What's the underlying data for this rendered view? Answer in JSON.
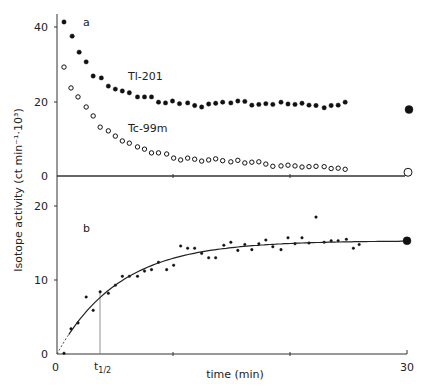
{
  "chart_data": [
    {
      "panel": "a",
      "type": "scatter",
      "title": "",
      "panel_label": "a",
      "xlabel": "time (min)",
      "ylabel": "Isotope activity (ct min-1·10^3)",
      "xlim": [
        0,
        30
      ],
      "ylim": [
        0,
        44
      ],
      "yticks": [
        0,
        20,
        40
      ],
      "grid": false,
      "series": [
        {
          "name": "Tl-201",
          "marker": "filled",
          "x": [
            0.6,
            1.3,
            1.9,
            2.5,
            3.1,
            3.8,
            4.4,
            5.0,
            5.6,
            6.2,
            6.9,
            7.5,
            8.1,
            8.7,
            9.3,
            9.9,
            10.5,
            11.2,
            11.8,
            12.4,
            13.0,
            13.6,
            14.2,
            14.9,
            15.5,
            16.1,
            16.7,
            17.3,
            17.9,
            18.5,
            19.2,
            19.8,
            20.4,
            21.0,
            21.6,
            22.2,
            22.9,
            23.5,
            24.1,
            24.7
          ],
          "y": [
            41.3,
            37.5,
            33.2,
            30.6,
            26.8,
            26.3,
            24.1,
            23.3,
            22.8,
            22.3,
            21.2,
            21.2,
            21.2,
            19.8,
            19.6,
            20.1,
            19.4,
            19.6,
            18.9,
            18.5,
            19.3,
            19.5,
            19.8,
            19.6,
            20.1,
            20.0,
            19.0,
            19.2,
            19.4,
            19.2,
            19.8,
            19.3,
            19.2,
            19.5,
            19.0,
            18.9,
            18.3,
            18.9,
            19.0,
            19.8
          ],
          "annotation": "Tl-201",
          "end_value": {
            "x": 30,
            "y": 17.8,
            "marker": "large-filled"
          }
        },
        {
          "name": "Tc-99m",
          "marker": "open",
          "x": [
            0.6,
            1.2,
            1.8,
            2.5,
            3.1,
            3.7,
            4.4,
            5.0,
            5.6,
            6.2,
            6.9,
            7.5,
            8.1,
            8.7,
            9.4,
            10.0,
            10.6,
            11.2,
            11.8,
            12.4,
            13.0,
            13.6,
            14.2,
            14.9,
            15.5,
            16.1,
            16.7,
            17.3,
            17.9,
            18.5,
            19.2,
            19.8,
            20.4,
            21.0,
            21.6,
            22.2,
            22.9,
            23.5,
            24.1,
            24.7
          ],
          "y": [
            29.2,
            23.6,
            21.2,
            18.5,
            16.1,
            13.1,
            12.1,
            10.7,
            9.4,
            8.8,
            7.8,
            7.2,
            6.2,
            6.2,
            5.9,
            4.8,
            4.3,
            4.8,
            4.5,
            4.0,
            4.3,
            4.6,
            4.1,
            3.8,
            4.2,
            3.5,
            3.7,
            3.8,
            3.2,
            2.6,
            2.7,
            2.9,
            2.7,
            2.4,
            2.5,
            2.6,
            2.5,
            2.0,
            2.1,
            1.8
          ],
          "annotation": "Tc-99m",
          "end_value": {
            "x": 30,
            "y": 1.0,
            "marker": "large-open"
          }
        }
      ]
    },
    {
      "panel": "b",
      "type": "scatter",
      "title": "",
      "panel_label": "b",
      "xlabel": "time (min)",
      "ylabel": "Isotope activity (ct min-1·10^3)",
      "xlim": [
        0,
        30
      ],
      "ylim": [
        0,
        22
      ],
      "yticks": [
        0,
        10,
        20
      ],
      "xticks": [
        0,
        30
      ],
      "xtick_labels": [
        "0",
        "t1/2",
        "30"
      ],
      "half_time_x": 3.7,
      "grid": false,
      "series": [
        {
          "name": "difference data",
          "marker": "small-dot",
          "x": [
            0.6,
            1.2,
            1.8,
            2.5,
            3.1,
            3.7,
            4.4,
            5.0,
            5.6,
            6.2,
            6.9,
            7.5,
            8.1,
            8.7,
            9.4,
            10.0,
            10.6,
            11.2,
            11.8,
            12.4,
            13.0,
            13.6,
            14.3,
            14.9,
            15.5,
            16.1,
            16.7,
            17.3,
            17.9,
            18.5,
            19.2,
            19.8,
            20.4,
            21.0,
            21.6,
            22.2,
            22.9,
            23.5,
            24.1,
            24.8,
            25.4,
            25.9
          ],
          "y": [
            0.1,
            3.4,
            4.2,
            7.7,
            5.9,
            8.4,
            8.2,
            9.3,
            10.5,
            10.5,
            10.5,
            11.2,
            11.4,
            12.4,
            11.4,
            12.0,
            14.6,
            14.3,
            14.3,
            13.6,
            13.0,
            13.0,
            14.7,
            15.1,
            14.0,
            14.8,
            14.1,
            14.9,
            15.4,
            14.5,
            14.1,
            15.7,
            14.9,
            15.7,
            15.0,
            18.5,
            15.1,
            15.3,
            15.3,
            15.5,
            14.3,
            14.8
          ],
          "end_value": {
            "x": 30,
            "y": 15.3,
            "marker": "large-filled"
          }
        },
        {
          "name": "fitted curve",
          "type": "line",
          "model": "A(1-exp(-kt))",
          "plateau": 15.3,
          "t_half": 3.7
        }
      ]
    }
  ],
  "labels": {
    "panel_a": "a",
    "panel_b": "b",
    "tl": "Tl-201",
    "tc": "Tc-99m",
    "ylabel": "Isotope activity  (ct min⁻¹·10³)",
    "xlabel": "time  (min)",
    "x0": "0",
    "x30": "30",
    "thalf": "t",
    "thalf_sub": "1/2",
    "ya": [
      "0",
      "20",
      "40"
    ],
    "yb": [
      "0",
      "10",
      "20"
    ]
  }
}
